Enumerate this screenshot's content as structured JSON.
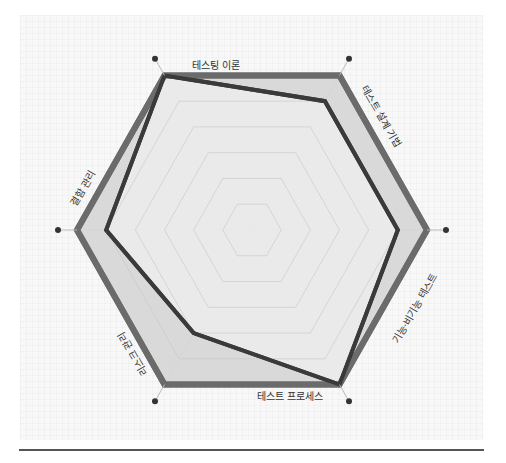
{
  "chart_data": {
    "type": "radar",
    "title": "",
    "axes": [
      "테스팅 이론",
      "테스트 설계 기법",
      "기능·비기능 테스트",
      "테스트 프로세스",
      "리스크 관리",
      "결함 관리"
    ],
    "scale": {
      "min": 0,
      "max": 6,
      "rings": 6
    },
    "series": [
      {
        "name": "기준",
        "values": [
          6,
          6,
          6,
          6,
          6,
          6
        ],
        "stroke": "#6b6b6b",
        "fill": "#d6d6d6"
      },
      {
        "name": "점수",
        "values": [
          6,
          5,
          5,
          6,
          4,
          5
        ],
        "stroke": "#3a3a3a",
        "fill": "#ececec"
      }
    ],
    "grid": true,
    "legend": "none"
  },
  "colors": {
    "panel_bg": "#f8f8f8",
    "grid_line": "#c8c8c8",
    "axis_dot": "#333333",
    "divider": "#555555"
  }
}
